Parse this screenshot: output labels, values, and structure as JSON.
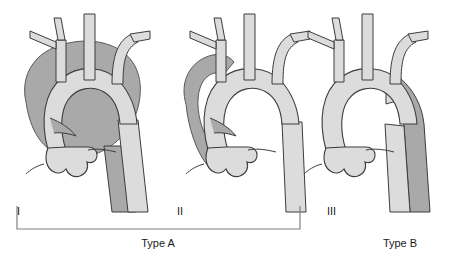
{
  "figure": {
    "background_color": "#ffffff",
    "width": 457,
    "height": 256
  },
  "colors": {
    "outline": "#3c3c3c",
    "lumen_light": "#dcdcdc",
    "dissection_dark": "#a9a9a9",
    "dissection_mid": "#b8b8b8",
    "text": "#1a1a1a",
    "bracket": "#808080"
  },
  "panels": [
    {
      "id": "panel-1",
      "roman_numeral": "I",
      "description": "DeBakey type I - dissection involves ascending aorta, arch and descending aorta",
      "dissection_extent": "entire aorta"
    },
    {
      "id": "panel-2",
      "roman_numeral": "II",
      "description": "DeBakey type II - dissection confined to ascending aorta",
      "dissection_extent": "ascending aorta only"
    },
    {
      "id": "panel-3",
      "roman_numeral": "III",
      "description": "DeBakey type III - dissection confined to descending aorta",
      "dissection_extent": "descending aorta only"
    }
  ],
  "groups": [
    {
      "id": "group-type-a",
      "label": "Type A",
      "covers": [
        "I",
        "II"
      ],
      "bracket": true
    },
    {
      "id": "group-type-b",
      "label": "Type B",
      "covers": [
        "III"
      ],
      "bracket": false
    }
  ]
}
